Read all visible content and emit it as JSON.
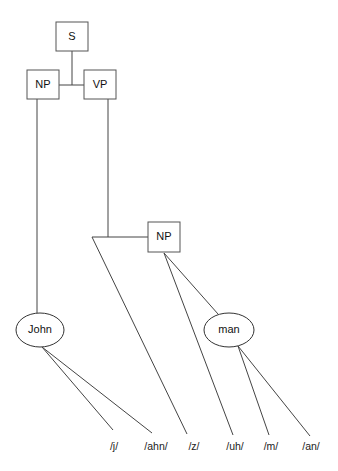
{
  "diagram": {
    "type": "syntax-tree",
    "nodes": {
      "s": {
        "label": "S"
      },
      "np1": {
        "label": "NP"
      },
      "vp": {
        "label": "VP"
      },
      "np2": {
        "label": "NP"
      },
      "john": {
        "label": "John"
      },
      "man": {
        "label": "man"
      }
    },
    "phonemes": [
      {
        "id": "j",
        "label": "/j/"
      },
      {
        "id": "ahn",
        "label": "/ahn/"
      },
      {
        "id": "z",
        "label": "/z/"
      },
      {
        "id": "uh",
        "label": "/uh/"
      },
      {
        "id": "m",
        "label": "/m/"
      },
      {
        "id": "an",
        "label": "/an/"
      }
    ],
    "edges": [
      [
        "S",
        "NP"
      ],
      [
        "S",
        "VP"
      ],
      [
        "NP",
        "John"
      ],
      [
        "VP",
        "NP(2)"
      ],
      [
        "VP",
        "/z/"
      ],
      [
        "John",
        "/j/"
      ],
      [
        "John",
        "/ahn/"
      ],
      [
        "NP(2)",
        "man"
      ],
      [
        "NP(2)",
        "/uh/"
      ],
      [
        "man",
        "/m/"
      ],
      [
        "man",
        "/an/"
      ]
    ]
  }
}
